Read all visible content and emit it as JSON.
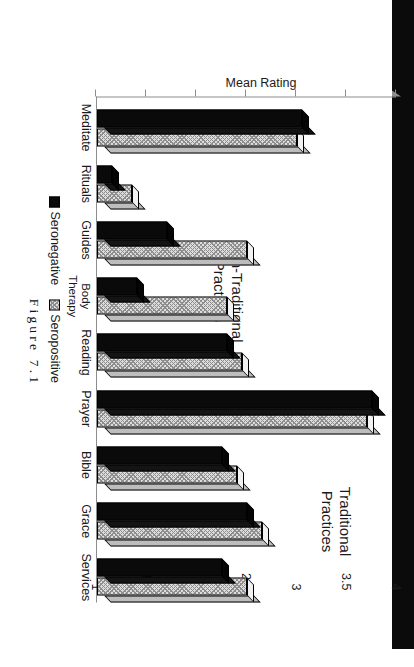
{
  "figure": {
    "caption": "Figure 7.1"
  },
  "chart_data": {
    "type": "bar",
    "title": "",
    "orientation": "vertical-bars-on-rotated-page",
    "xlabel": "",
    "ylabel": "Mean Rating",
    "ylim": [
      1,
      4
    ],
    "yticks": [
      4,
      3.5,
      3,
      2.5,
      2,
      1.5,
      1
    ],
    "ytick_labels": [
      "4",
      "3.5",
      "3",
      "2.5",
      "2",
      "1.5",
      "1"
    ],
    "grid": false,
    "legend_position": "below-axis",
    "categories": [
      "Meditate",
      "Rituals",
      "Guides",
      "Body\nTherapy",
      "Reading",
      "Prayer",
      "Bible",
      "Grace",
      "Services"
    ],
    "series": [
      {
        "name": "Seronegative",
        "color": "#0a0a0a",
        "values": [
          3.05,
          1.15,
          1.7,
          1.4,
          2.3,
          3.75,
          2.25,
          2.5,
          2.25
        ]
      },
      {
        "name": "Seropositive",
        "color": "#dcdcdc",
        "values": [
          3.0,
          1.35,
          2.5,
          2.3,
          2.45,
          3.7,
          2.4,
          2.65,
          2.5
        ]
      }
    ],
    "annotations": [
      {
        "text": "Non-Traditional\nPractices",
        "covers": [
          "Meditate",
          "Rituals",
          "Guides",
          "Body Therapy"
        ]
      },
      {
        "text": "Traditional\nPractices",
        "covers": [
          "Reading",
          "Prayer",
          "Bible",
          "Grace",
          "Services"
        ]
      }
    ]
  },
  "legend": {
    "items": [
      {
        "label": "Seronegative",
        "swatch": "solid-black-square"
      },
      {
        "label": "Seropositive",
        "swatch": "hatched-light-square"
      }
    ]
  }
}
